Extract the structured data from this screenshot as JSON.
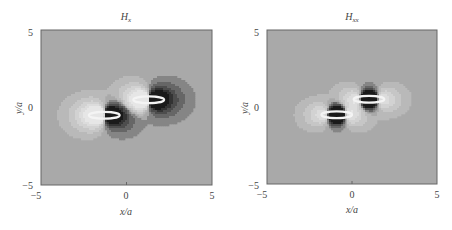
{
  "chart_data": [
    {
      "type": "contour",
      "title": "H",
      "title_subscript": "x",
      "xlabel": "x/a",
      "ylabel": "y/a",
      "xlim": [
        -5,
        5
      ],
      "ylim": [
        -5,
        5
      ],
      "xticks": [
        "-5",
        "0",
        "5"
      ],
      "yticks": [
        "-5",
        "0",
        "5"
      ],
      "background_color": "#a9a9a9",
      "colormap": "grayscale",
      "grid": false,
      "particles": [
        {
          "cx": -1.3,
          "cy": -0.5,
          "rx": 0.9,
          "ry": 0.22
        },
        {
          "cx": 1.3,
          "cy": 0.5,
          "rx": 0.9,
          "ry": 0.22
        }
      ],
      "field": "dipole_x"
    },
    {
      "type": "contour",
      "title": "H",
      "title_subscript": "xx",
      "xlabel": "x/a",
      "ylabel": "y/a",
      "xlim": [
        -5,
        5
      ],
      "ylim": [
        -5,
        5
      ],
      "xticks": [
        "-5",
        "0",
        "5"
      ],
      "yticks": [
        "-5",
        "0",
        "5"
      ],
      "background_color": "#a9a9a9",
      "colormap": "grayscale",
      "grid": false,
      "particles": [
        {
          "cx": -0.9,
          "cy": -0.5,
          "rx": 0.9,
          "ry": 0.22
        },
        {
          "cx": 1.0,
          "cy": 0.5,
          "rx": 0.9,
          "ry": 0.22
        }
      ],
      "field": "quadrupole_xx"
    }
  ]
}
